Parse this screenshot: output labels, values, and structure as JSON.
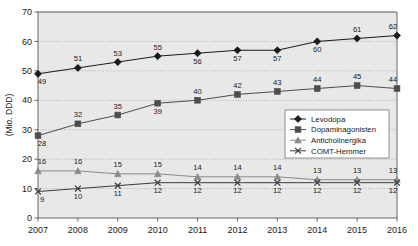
{
  "chart_data": {
    "type": "line",
    "title": "",
    "subtitle": "",
    "xlabel": "",
    "ylabel": "(Mio. DDD)",
    "categories": [
      "2007",
      "2008",
      "2009",
      "2010",
      "2011",
      "2012",
      "2013",
      "2014",
      "2015",
      "2016"
    ],
    "x": [
      2007,
      2008,
      2009,
      2010,
      2011,
      2012,
      2013,
      2014,
      2015,
      2016
    ],
    "ylim": [
      0,
      70
    ],
    "yticks": [
      0,
      10,
      20,
      30,
      40,
      50,
      60,
      70
    ],
    "grid": true,
    "grid_style": "dotted-horizontal",
    "legend_position": "center-right",
    "plot_background": "#e8e8e8",
    "series": [
      {
        "name": "Levodopa",
        "marker": "diamond",
        "color": "#1a1a1a",
        "values": [
          49,
          51,
          53,
          55,
          56,
          57,
          57,
          60,
          61,
          62
        ],
        "label_positions": [
          "below",
          "above",
          "above",
          "above",
          "below",
          "below",
          "below",
          "below",
          "above",
          "above"
        ]
      },
      {
        "name": "Dopaminagonisten",
        "marker": "square",
        "color": "#4d4d4d",
        "values": [
          28,
          32,
          35,
          39,
          40,
          42,
          43,
          44,
          45,
          44
        ],
        "label_positions": [
          "below",
          "above",
          "above",
          "below",
          "above",
          "above",
          "above",
          "above",
          "above",
          "above"
        ]
      },
      {
        "name": "Anticholinergika",
        "marker": "triangle",
        "color": "#8a8a8a",
        "values": [
          16,
          16,
          15,
          15,
          14,
          14,
          14,
          13,
          13,
          13
        ],
        "label_positions": [
          "above",
          "above",
          "above",
          "above",
          "above",
          "above",
          "above",
          "above",
          "above",
          "above"
        ]
      },
      {
        "name": "COMT-Hemmer",
        "marker": "x",
        "color": "#3c3c3c",
        "values": [
          9,
          10,
          11,
          12,
          12,
          12,
          12,
          12,
          12,
          12
        ],
        "label_positions": [
          "below",
          "below",
          "below",
          "below",
          "below",
          "below",
          "below",
          "below",
          "below",
          "below"
        ]
      }
    ]
  },
  "legend": {
    "items": [
      {
        "label": "Levodopa"
      },
      {
        "label": "Dopaminagonisten"
      },
      {
        "label": "Anticholinergika"
      },
      {
        "label": "COMT-Hemmer"
      }
    ]
  }
}
